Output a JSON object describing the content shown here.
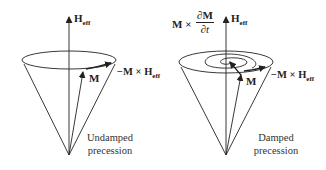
{
  "colors": {
    "stroke": "#222222",
    "text": "#222222",
    "background": "#ffffff"
  },
  "left_panel": {
    "axis_label": {
      "main": "H",
      "sub": "eff"
    },
    "vector_label": "M",
    "torque_label": {
      "prefix": "−M × H",
      "sub": "eff"
    },
    "caption_line1": "Undamped",
    "caption_line2": "precession"
  },
  "right_panel": {
    "axis_label": {
      "main": "H",
      "sub": "eff"
    },
    "damping_label": {
      "prefix": "M ×",
      "numerator": "∂M",
      "denominator": "∂t"
    },
    "vector_label": "M",
    "torque_label": {
      "prefix": "−M × H",
      "sub": "eff"
    },
    "caption_line1": "Damped",
    "caption_line2": "precession"
  }
}
